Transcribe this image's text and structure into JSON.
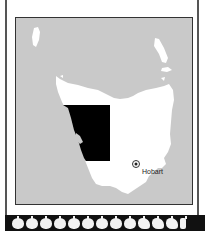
{
  "map": {
    "region": "Tasmania",
    "colors": {
      "sea": "#c9c9c9",
      "land": "#ffffff",
      "highlight": "#000000",
      "border": "#333333"
    },
    "cities": [
      {
        "name": "Hobart",
        "marker": "circle-dot"
      }
    ],
    "highlighted_area": {
      "shape": "rectangle",
      "fill": "#000000"
    }
  },
  "footer_strip": {
    "icon": "apple-icon",
    "count": 13,
    "last_variant": "apple-core"
  }
}
